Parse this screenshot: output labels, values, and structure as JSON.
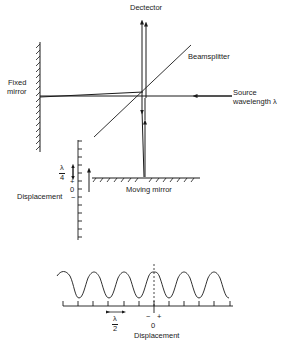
{
  "labels": {
    "detector": "Dectector",
    "beamsplitter": "Beamsplitter",
    "source_line1": "Source",
    "source_line2": "wavelength λ",
    "fixed_mirror_line1": "Fixed",
    "fixed_mirror_line2": "mirror",
    "moving_mirror": "Moving mirror",
    "displacement_vertical": "Displacement",
    "lambda_over_4_num": "λ",
    "lambda_over_4_den": "4",
    "plus_sign": "+",
    "zero": "0",
    "minus_sign": "−"
  },
  "interferogram": {
    "xlabel": "Displacement",
    "zero_label": "0",
    "minus_label": "−",
    "plus_label": "+",
    "period_num": "λ",
    "period_den": "2"
  },
  "colors": {
    "ink": "#1a1a1a",
    "background": "#ffffff"
  }
}
